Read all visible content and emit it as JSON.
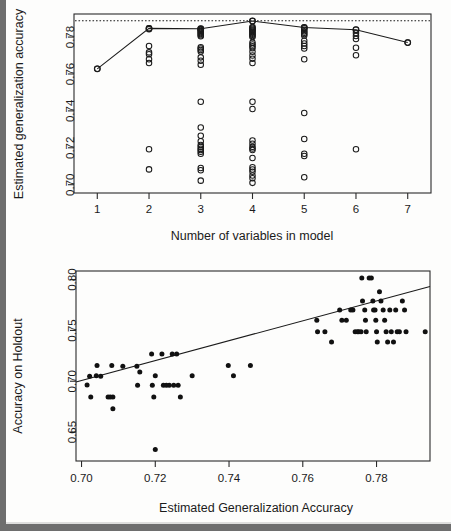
{
  "page": {
    "background_color": "#fdfdfc",
    "border_color": "#6e6e6e"
  },
  "chart_data": [
    {
      "id": "top",
      "type": "scatter",
      "title": "",
      "xlabel": "Number of variables in model",
      "ylabel": "Estimated generalization accuracy",
      "xlim": [
        0.55,
        7.45
      ],
      "ylim": [
        0.6955,
        0.7925
      ],
      "xticks": [
        1,
        2,
        3,
        4,
        5,
        6,
        7
      ],
      "xticklabels": [
        "1",
        "2",
        "3",
        "4",
        "5",
        "6",
        "7"
      ],
      "yticks": [
        0.7,
        0.72,
        0.74,
        0.76,
        0.78
      ],
      "yticklabels": [
        "0.70",
        "0.72",
        "0.74",
        "0.76",
        "0.78"
      ],
      "grid": false,
      "legend": null,
      "marker": "open-circle",
      "reference_line": {
        "style": "dotted",
        "orientation": "horizontal",
        "y": 0.7888
      },
      "series": [
        {
          "name": "best model per size",
          "style": "line-with-open-circles",
          "x": [
            1,
            2,
            3,
            4,
            5,
            6,
            7
          ],
          "values": [
            0.7628,
            0.7847,
            0.7845,
            0.7887,
            0.7852,
            0.784,
            0.777
          ]
        },
        {
          "name": "all models",
          "style": "open-circles",
          "points": [
            [
              1,
              0.7628
            ],
            [
              2,
              0.7847
            ],
            [
              2,
              0.7843
            ],
            [
              2,
              0.7752
            ],
            [
              2,
              0.7717
            ],
            [
              2,
              0.7707
            ],
            [
              2,
              0.768
            ],
            [
              2,
              0.766
            ],
            [
              2,
              0.7192
            ],
            [
              2,
              0.7083
            ],
            [
              3,
              0.7845
            ],
            [
              3,
              0.7842
            ],
            [
              3,
              0.7838
            ],
            [
              3,
              0.7833
            ],
            [
              3,
              0.7828
            ],
            [
              3,
              0.7822
            ],
            [
              3,
              0.7816
            ],
            [
              3,
              0.781
            ],
            [
              3,
              0.7804
            ],
            [
              3,
              0.7745
            ],
            [
              3,
              0.7738
            ],
            [
              3,
              0.773
            ],
            [
              3,
              0.7722
            ],
            [
              3,
              0.769
            ],
            [
              3,
              0.7672
            ],
            [
              3,
              0.765
            ],
            [
              3,
              0.745
            ],
            [
              3,
              0.731
            ],
            [
              3,
              0.7265
            ],
            [
              3,
              0.7235
            ],
            [
              3,
              0.7215
            ],
            [
              3,
              0.7205
            ],
            [
              3,
              0.7195
            ],
            [
              3,
              0.7188
            ],
            [
              3,
              0.7178
            ],
            [
              3,
              0.7168
            ],
            [
              3,
              0.709
            ],
            [
              3,
              0.7078
            ],
            [
              3,
              0.7022
            ],
            [
              4,
              0.7887
            ],
            [
              4,
              0.7855
            ],
            [
              4,
              0.785
            ],
            [
              4,
              0.7845
            ],
            [
              4,
              0.784
            ],
            [
              4,
              0.7835
            ],
            [
              4,
              0.783
            ],
            [
              4,
              0.7824
            ],
            [
              4,
              0.7818
            ],
            [
              4,
              0.7812
            ],
            [
              4,
              0.7806
            ],
            [
              4,
              0.78
            ],
            [
              4,
              0.777
            ],
            [
              4,
              0.776
            ],
            [
              4,
              0.775
            ],
            [
              4,
              0.774
            ],
            [
              4,
              0.772
            ],
            [
              4,
              0.77
            ],
            [
              4,
              0.7682
            ],
            [
              4,
              0.766
            ],
            [
              4,
              0.745
            ],
            [
              4,
              0.741
            ],
            [
              4,
              0.724
            ],
            [
              4,
              0.7222
            ],
            [
              4,
              0.7205
            ],
            [
              4,
              0.7196
            ],
            [
              4,
              0.7188
            ],
            [
              4,
              0.7145
            ],
            [
              4,
              0.7095
            ],
            [
              4,
              0.7082
            ],
            [
              4,
              0.707
            ],
            [
              4,
              0.705
            ],
            [
              4,
              0.7035
            ],
            [
              4,
              0.701
            ],
            [
              5,
              0.7852
            ],
            [
              5,
              0.7848
            ],
            [
              5,
              0.784
            ],
            [
              5,
              0.7832
            ],
            [
              5,
              0.7824
            ],
            [
              5,
              0.7816
            ],
            [
              5,
              0.7808
            ],
            [
              5,
              0.778
            ],
            [
              5,
              0.7765
            ],
            [
              5,
              0.7752
            ],
            [
              5,
              0.7738
            ],
            [
              5,
              0.768
            ],
            [
              5,
              0.7388
            ],
            [
              5,
              0.7248
            ],
            [
              5,
              0.7168
            ],
            [
              5,
              0.7155
            ],
            [
              5,
              0.704
            ],
            [
              6,
              0.784
            ],
            [
              6,
              0.7822
            ],
            [
              6,
              0.7806
            ],
            [
              6,
              0.779
            ],
            [
              6,
              0.7742
            ],
            [
              6,
              0.7702
            ],
            [
              6,
              0.7192
            ],
            [
              7,
              0.777
            ]
          ]
        }
      ]
    },
    {
      "id": "bottom",
      "type": "scatter",
      "title": "",
      "xlabel": "Estimated Generalization Accuracy",
      "ylabel": "Accuracy on Holdout",
      "xlim": [
        0.6985,
        0.7945
      ],
      "ylim": [
        0.6215,
        0.8085
      ],
      "xticks": [
        0.7,
        0.72,
        0.74,
        0.76,
        0.78
      ],
      "xticklabels": [
        "0.70",
        "0.72",
        "0.74",
        "0.76",
        "0.78"
      ],
      "yticks": [
        0.65,
        0.7,
        0.75,
        0.8
      ],
      "yticklabels": [
        "0.65",
        "0.70",
        "0.75",
        "0.80"
      ],
      "grid": false,
      "legend": null,
      "marker": "filled-circle",
      "fit_line": {
        "style": "solid",
        "x": [
          0.6985,
          0.7945
        ],
        "y": [
          0.6993,
          0.7932
        ]
      },
      "points": [
        [
          0.7015,
          0.6963
        ],
        [
          0.7022,
          0.705
        ],
        [
          0.7025,
          0.6845
        ],
        [
          0.704,
          0.7055
        ],
        [
          0.7042,
          0.7155
        ],
        [
          0.7052,
          0.705
        ],
        [
          0.7072,
          0.6845
        ],
        [
          0.7078,
          0.6845
        ],
        [
          0.7082,
          0.7155
        ],
        [
          0.7085,
          0.6845
        ],
        [
          0.7085,
          0.673
        ],
        [
          0.7112,
          0.7148
        ],
        [
          0.715,
          0.7148
        ],
        [
          0.7152,
          0.696
        ],
        [
          0.7158,
          0.7092
        ],
        [
          0.719,
          0.7268
        ],
        [
          0.7192,
          0.696
        ],
        [
          0.7196,
          0.6845
        ],
        [
          0.72,
          0.7055
        ],
        [
          0.72,
          0.6328
        ],
        [
          0.7218,
          0.7268
        ],
        [
          0.7222,
          0.696
        ],
        [
          0.723,
          0.696
        ],
        [
          0.7238,
          0.696
        ],
        [
          0.7246,
          0.7268
        ],
        [
          0.725,
          0.696
        ],
        [
          0.7258,
          0.7268
        ],
        [
          0.7262,
          0.696
        ],
        [
          0.7268,
          0.6845
        ],
        [
          0.73,
          0.7055
        ],
        [
          0.7398,
          0.7155
        ],
        [
          0.7412,
          0.7055
        ],
        [
          0.7458,
          0.7155
        ],
        [
          0.7638,
          0.76
        ],
        [
          0.764,
          0.7488
        ],
        [
          0.766,
          0.7488
        ],
        [
          0.7678,
          0.7385
        ],
        [
          0.77,
          0.77
        ],
        [
          0.7706,
          0.76
        ],
        [
          0.7718,
          0.76
        ],
        [
          0.773,
          0.77
        ],
        [
          0.7736,
          0.77
        ],
        [
          0.7742,
          0.7488
        ],
        [
          0.7748,
          0.7488
        ],
        [
          0.7752,
          0.7488
        ],
        [
          0.7758,
          0.7488
        ],
        [
          0.776,
          0.8015
        ],
        [
          0.7762,
          0.779
        ],
        [
          0.7768,
          0.77
        ],
        [
          0.777,
          0.76
        ],
        [
          0.7772,
          0.7488
        ],
        [
          0.778,
          0.8015
        ],
        [
          0.7786,
          0.8015
        ],
        [
          0.779,
          0.779
        ],
        [
          0.7792,
          0.77
        ],
        [
          0.7796,
          0.77
        ],
        [
          0.7798,
          0.76
        ],
        [
          0.78,
          0.7488
        ],
        [
          0.7802,
          0.7385
        ],
        [
          0.7808,
          0.788
        ],
        [
          0.7812,
          0.779
        ],
        [
          0.7818,
          0.77
        ],
        [
          0.7822,
          0.76
        ],
        [
          0.7826,
          0.7488
        ],
        [
          0.783,
          0.7385
        ],
        [
          0.7836,
          0.77
        ],
        [
          0.784,
          0.7488
        ],
        [
          0.7846,
          0.7385
        ],
        [
          0.7852,
          0.77
        ],
        [
          0.7856,
          0.7488
        ],
        [
          0.7862,
          0.7488
        ],
        [
          0.787,
          0.779
        ],
        [
          0.7876,
          0.77
        ],
        [
          0.788,
          0.7488
        ],
        [
          0.7932,
          0.7488
        ]
      ]
    }
  ]
}
